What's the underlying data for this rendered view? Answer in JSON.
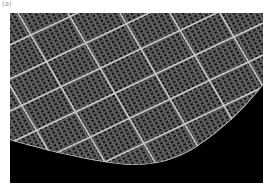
{
  "figure": {
    "panel_label": "(a)",
    "colors": {
      "background": "#000000",
      "mesh_fine": "#8a8a8a",
      "grid_lines": "#d8d8d8",
      "page": "#ffffff"
    }
  }
}
